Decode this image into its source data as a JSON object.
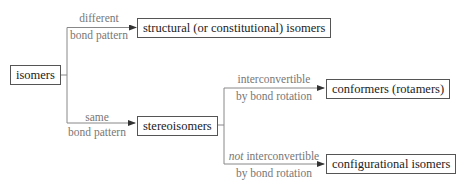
{
  "diagram": {
    "root": {
      "label": "isomers"
    },
    "branches": [
      {
        "edge_label_top": "different",
        "edge_label_bottom": "bond pattern",
        "target": "structural (or constitutional) isomers"
      },
      {
        "edge_label_top": "same",
        "edge_label_bottom": "bond pattern",
        "target": "stereoisomers",
        "children": [
          {
            "edge_label_top": "interconvertible",
            "edge_label_bottom": "by bond rotation",
            "target": "conformers (rotamers)"
          },
          {
            "edge_label_top_emphasis": "not",
            "edge_label_top": " interconvertible",
            "edge_label_bottom": "by bond rotation",
            "target": "configurational isomers"
          }
        ]
      }
    ]
  },
  "colors": {
    "line": "#777777",
    "box_border": "#555555",
    "label": "#777777",
    "text": "#222222"
  }
}
